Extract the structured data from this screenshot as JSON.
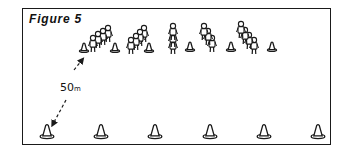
{
  "figure": {
    "title": "Figure 5",
    "distance_label": "50",
    "distance_unit": "m"
  },
  "top_cones": [
    {
      "x": 84,
      "y": 52
    },
    {
      "x": 115,
      "y": 52
    },
    {
      "x": 149,
      "y": 52
    },
    {
      "x": 190,
      "y": 51
    },
    {
      "x": 231,
      "y": 51
    },
    {
      "x": 272,
      "y": 51
    }
  ],
  "bottom_cones": [
    {
      "x": 47,
      "y": 138
    },
    {
      "x": 101,
      "y": 138
    },
    {
      "x": 155,
      "y": 138
    },
    {
      "x": 210,
      "y": 138
    },
    {
      "x": 264,
      "y": 138
    },
    {
      "x": 318,
      "y": 138
    }
  ],
  "groups": [
    {
      "name": "group-1",
      "people": [
        {
          "x": 93,
          "y": 38
        },
        {
          "x": 98,
          "y": 34
        },
        {
          "x": 103,
          "y": 31
        },
        {
          "x": 108,
          "y": 28
        }
      ]
    },
    {
      "name": "group-2",
      "people": [
        {
          "x": 131,
          "y": 40
        },
        {
          "x": 136,
          "y": 36
        },
        {
          "x": 140,
          "y": 32
        },
        {
          "x": 144,
          "y": 28
        }
      ]
    },
    {
      "name": "group-3",
      "people": [
        {
          "x": 173,
          "y": 26
        },
        {
          "x": 173,
          "y": 33
        },
        {
          "x": 173,
          "y": 40
        }
      ]
    },
    {
      "name": "group-4",
      "people": [
        {
          "x": 204,
          "y": 26
        },
        {
          "x": 208,
          "y": 31
        },
        {
          "x": 212,
          "y": 38
        }
      ]
    },
    {
      "name": "group-5",
      "people": [
        {
          "x": 241,
          "y": 24
        },
        {
          "x": 245,
          "y": 30
        },
        {
          "x": 249,
          "y": 35
        },
        {
          "x": 254,
          "y": 40
        }
      ]
    }
  ],
  "colors": {
    "ink": "#1a1a1a",
    "paper": "#ffffff"
  }
}
